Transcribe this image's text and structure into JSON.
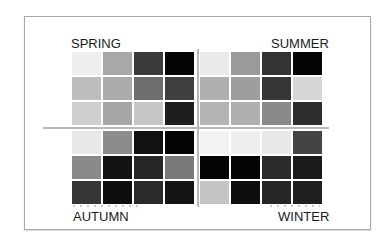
{
  "quadrants": {
    "spring": {
      "label": "SPRING",
      "cells": [
        "#eeeeee",
        "#a8a8a8",
        "#3a3a3a",
        "#050505",
        "#bdbdbd",
        "#ababab",
        "#6e6e6e",
        "#404040",
        "#cfcfcf",
        "#a6a6a6",
        "#c6c6c6",
        "#1e1e1e"
      ]
    },
    "summer": {
      "label": "SUMMER",
      "cells": [
        "#eaeaea",
        "#9a9a9a",
        "#333333",
        "#050505",
        "#b0b0b0",
        "#9e9e9e",
        "#363636",
        "#d6d6d6",
        "#b4b4b4",
        "#b0b0b0",
        "#8a8a8a",
        "#2e2e2e"
      ]
    },
    "autumn": {
      "label": "AUTUMN",
      "cells": [
        "#e8e8e8",
        "#8c8c8c",
        "#111111",
        "#050505",
        "#8a8a8a",
        "#121212",
        "#262626",
        "#7a7a7a",
        "#363636",
        "#0e0e0e",
        "#2a2a2a",
        "#141414"
      ]
    },
    "winter": {
      "label": "WINTER",
      "cells": [
        "#f2f2f2",
        "#eeeeee",
        "#e8e8e8",
        "#444444",
        "#050505",
        "#050505",
        "#2a2a2a",
        "#1a1a1a",
        "#c4c4c4",
        "#0e0e0e",
        "#262626",
        "#202020"
      ]
    }
  }
}
